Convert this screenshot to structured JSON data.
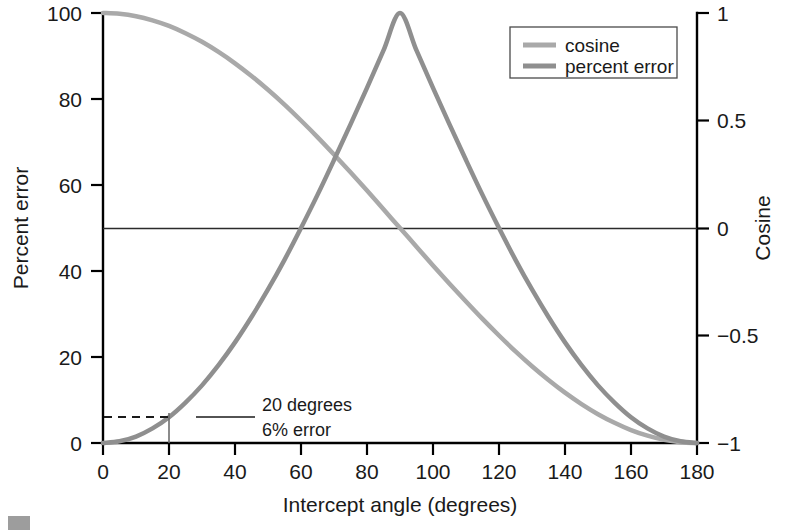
{
  "chart_data": {
    "type": "line",
    "title": "",
    "xlabel": "Intercept angle (degrees)",
    "ylabel": "Percent error",
    "y2label": "Cosine",
    "xlim": [
      0,
      180
    ],
    "ylim": [
      0,
      100
    ],
    "y2lim": [
      -1,
      1
    ],
    "grid": false,
    "legend_position": "top-right",
    "xticks": [
      0,
      20,
      40,
      60,
      80,
      100,
      120,
      140,
      160,
      180
    ],
    "xticklabels": [
      "0",
      "20",
      "40",
      "60",
      "80",
      "100",
      "120",
      "140",
      "160",
      "180"
    ],
    "yticks": [
      0,
      20,
      40,
      60,
      80,
      100
    ],
    "yticklabels": [
      "0",
      "20",
      "40",
      "60",
      "80",
      "100"
    ],
    "y2ticks": [
      -1,
      -0.5,
      0,
      0.5,
      1
    ],
    "y2ticklabels": [
      "−1",
      "−0.5",
      "0",
      "0.5",
      "1"
    ],
    "series": [
      {
        "name": "cosine",
        "axis": "right",
        "color": "#a9a9a9",
        "linewidth": 4.5,
        "x": [
          0,
          5,
          10,
          15,
          20,
          25,
          30,
          35,
          40,
          45,
          50,
          55,
          60,
          65,
          70,
          75,
          80,
          85,
          90,
          95,
          100,
          105,
          110,
          115,
          120,
          125,
          130,
          135,
          140,
          145,
          150,
          155,
          160,
          165,
          170,
          175,
          180
        ],
        "y": [
          1.0,
          0.996,
          0.985,
          0.966,
          0.94,
          0.906,
          0.866,
          0.819,
          0.766,
          0.707,
          0.643,
          0.574,
          0.5,
          0.423,
          0.342,
          0.259,
          0.174,
          0.087,
          0.0,
          -0.087,
          -0.174,
          -0.259,
          -0.342,
          -0.423,
          -0.5,
          -0.574,
          -0.643,
          -0.707,
          -0.766,
          -0.819,
          -0.866,
          -0.906,
          -0.94,
          -0.966,
          -0.985,
          -0.996,
          -1.0
        ]
      },
      {
        "name": "percent error",
        "axis": "left",
        "color": "#8f8f8f",
        "linewidth": 4.5,
        "x": [
          0,
          5,
          10,
          15,
          20,
          25,
          30,
          35,
          40,
          45,
          50,
          55,
          60,
          65,
          70,
          75,
          80,
          85,
          90,
          95,
          100,
          105,
          110,
          115,
          120,
          125,
          130,
          135,
          140,
          145,
          150,
          155,
          160,
          165,
          170,
          175,
          180
        ],
        "y": [
          0.0,
          0.4,
          1.5,
          3.4,
          6.0,
          9.4,
          13.4,
          18.1,
          23.4,
          29.3,
          35.7,
          42.6,
          50.0,
          57.7,
          65.8,
          74.1,
          82.6,
          91.3,
          100.0,
          91.3,
          82.6,
          74.1,
          65.8,
          57.7,
          50.0,
          42.6,
          35.7,
          29.3,
          23.4,
          18.1,
          13.4,
          9.4,
          6.0,
          3.4,
          1.5,
          0.4,
          0.0
        ]
      }
    ],
    "reference_lines": [
      {
        "name": "cosine-zero-line",
        "axis": "right",
        "value": 0,
        "orientation": "horizontal"
      }
    ],
    "annotations": [
      {
        "name": "callout",
        "line1": "20 degrees",
        "line2": "6% error",
        "x": 20,
        "y": 6
      }
    ]
  },
  "legend": {
    "entries": [
      {
        "label": "cosine",
        "color": "#a9a9a9"
      },
      {
        "label": "percent error",
        "color": "#8f8f8f"
      }
    ]
  },
  "axes": {
    "left_title": "Percent error",
    "right_title": "Cosine",
    "bottom_title": "Intercept angle (degrees)"
  }
}
